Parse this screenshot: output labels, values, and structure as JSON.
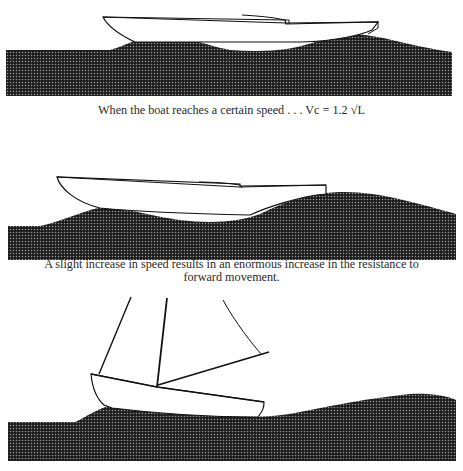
{
  "figure": {
    "panels": [
      {
        "id": "panel-1",
        "description": "Boat hull sitting in trough between bow wave and stern wave",
        "caption": "When the boat reaches a certain speed . . . Vc = 1.2 √L"
      },
      {
        "id": "panel-2",
        "description": "Boat hull climbing its own bow wave, stern sinking",
        "caption_line1": "A slight increase in speed results in an enormous increase in the resistance to",
        "caption_line2": "forward movement."
      },
      {
        "id": "panel-3",
        "description": "Sailboat with mast, stays and boom riding on a wave, bow raised"
      }
    ],
    "colors": {
      "water": "#1c1c1c",
      "water_dots": "#8a8a8a",
      "hull_stroke": "#111111",
      "hull_fill": "#ffffff",
      "text": "#2a2a2a"
    }
  }
}
